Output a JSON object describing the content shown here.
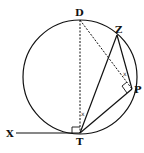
{
  "diagram": {
    "type": "circle-geometry",
    "circle": {
      "cx": 80,
      "cy": 77,
      "r": 57
    },
    "points": {
      "D": {
        "label": "D",
        "x": 80,
        "y": 20
      },
      "Z": {
        "label": "Z",
        "x": 117,
        "y": 35
      },
      "P": {
        "label": "P",
        "x": 132,
        "y": 89
      },
      "T": {
        "label": "T",
        "x": 80,
        "y": 133
      },
      "X": {
        "label": "X",
        "x": 16,
        "y": 133
      }
    },
    "solid_segments": [
      "XT",
      "TZ",
      "ZP",
      "PT"
    ],
    "dashed_segments": [
      "DT",
      "DP"
    ],
    "right_angles": [
      "XTD",
      "DPT"
    ],
    "angle_marks": [
      {
        "at": "T",
        "between": "DT,ZT",
        "mark": "x"
      },
      {
        "at": "P",
        "between": "DP,ZP",
        "mark": "x"
      }
    ],
    "colors": {
      "stroke": "#111111",
      "background": "#ffffff"
    }
  }
}
